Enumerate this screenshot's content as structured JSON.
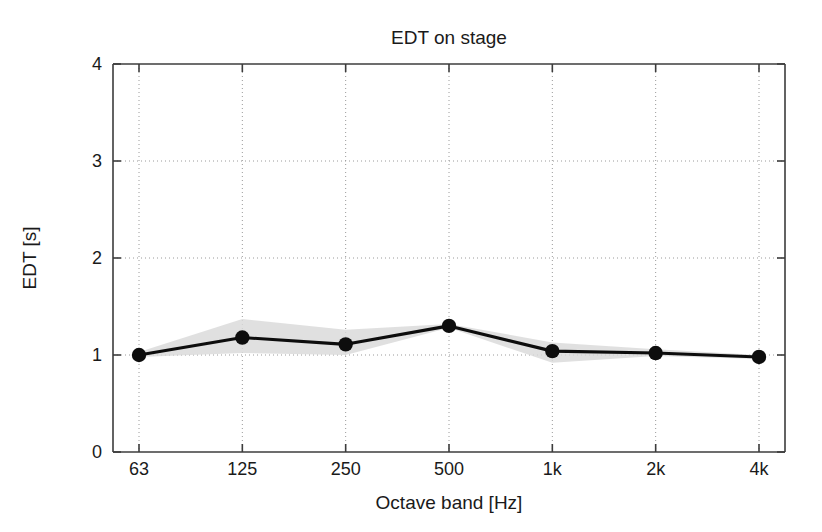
{
  "chart_data": {
    "type": "line",
    "title": "EDT on stage",
    "xlabel": "Octave band [Hz]",
    "ylabel": "EDT [s]",
    "categories": [
      "63",
      "125",
      "250",
      "500",
      "1k",
      "2k",
      "4k"
    ],
    "values": [
      1.0,
      1.18,
      1.11,
      1.3,
      1.04,
      1.02,
      0.98
    ],
    "series": [
      {
        "name": "EDT mean",
        "values": [
          1.0,
          1.18,
          1.11,
          1.3,
          1.04,
          1.02,
          0.98
        ]
      },
      {
        "name": "spread upper",
        "values": [
          1.03,
          1.37,
          1.26,
          1.32,
          1.13,
          1.06,
          1.0
        ]
      },
      {
        "name": "spread lower",
        "values": [
          0.98,
          1.02,
          1.0,
          1.28,
          0.92,
          0.99,
          0.96
        ]
      }
    ],
    "ylim": [
      0,
      4
    ],
    "yticks": [
      0,
      1,
      2,
      3,
      4
    ],
    "ytick_labels": [
      "0",
      "1",
      "2",
      "3",
      "4"
    ],
    "xtick_labels": [
      "63",
      "125",
      "250",
      "500",
      "1k",
      "2k",
      "4k"
    ],
    "grid": true,
    "grid_style": "dotted",
    "legend": "none",
    "marker": "filled-circle",
    "band_label": "shaded spread band",
    "colors": {
      "line": "#0d0d0d",
      "marker": "#0d0d0d",
      "band": "#d9d9d9",
      "axis": "#3c3c3c",
      "grid": "#9a9a9a",
      "background": "#ffffff",
      "text": "#1a1a1a"
    }
  }
}
